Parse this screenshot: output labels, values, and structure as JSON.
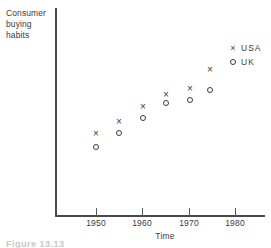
{
  "figure": {
    "caption": "Figure 13.13"
  },
  "chart_data": {
    "type": "scatter",
    "title": "",
    "xlabel": "Time",
    "ylabel": "Consumer buying habits",
    "grid": false,
    "legend_position": "top-right",
    "xlim": [
      1945,
      1990
    ],
    "ylim": [
      0,
      100
    ],
    "x_ticks": [
      1950,
      1960,
      1970,
      1980
    ],
    "x_tick_labels": [
      "1950",
      "1960",
      "1970",
      "1980"
    ],
    "y_ticks": [],
    "y_tick_labels": [],
    "legend": [
      {
        "label": "USA",
        "marker": "cross-marker"
      },
      {
        "label": "UK",
        "marker": "circle-marker"
      }
    ],
    "series": [
      {
        "name": "USA",
        "marker": "cross-marker",
        "x": [
          1950,
          1955,
          1960,
          1965,
          1970,
          1974
        ],
        "points_px": [
          {
            "x": 96,
            "y": 134
          },
          {
            "x": 119,
            "y": 122
          },
          {
            "x": 143,
            "y": 107
          },
          {
            "x": 166,
            "y": 95
          },
          {
            "x": 190,
            "y": 89
          },
          {
            "x": 210,
            "y": 70
          }
        ]
      },
      {
        "name": "UK",
        "marker": "circle-marker",
        "x": [
          1950,
          1955,
          1960,
          1965,
          1970,
          1974
        ],
        "points_px": [
          {
            "x": 96,
            "y": 147
          },
          {
            "x": 119,
            "y": 133
          },
          {
            "x": 143,
            "y": 118
          },
          {
            "x": 166,
            "y": 103
          },
          {
            "x": 190,
            "y": 100
          },
          {
            "x": 210,
            "y": 90
          }
        ]
      }
    ],
    "axis_px": {
      "x_origin": 55,
      "y_origin": 216,
      "x_end": 265,
      "y_top": 8,
      "tick_px": [
        96,
        142,
        189,
        235
      ]
    }
  }
}
